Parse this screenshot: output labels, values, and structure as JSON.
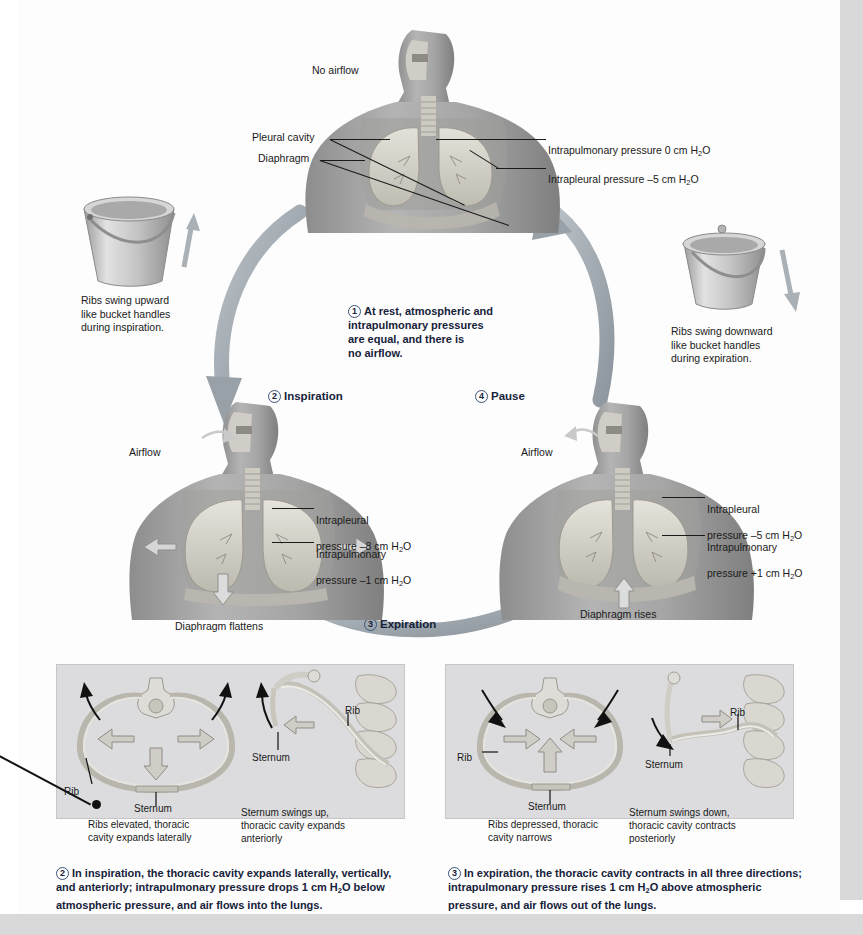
{
  "figure": {
    "background_color": "#fdfdfd",
    "panel_color": "#dcdcde",
    "arrow_color": "#9aa3ab",
    "step_number_color": "#3b5378"
  },
  "top_figure": {
    "airflow_label": "No airflow",
    "left_labels": [
      {
        "text": "Pleural cavity"
      },
      {
        "text": "Diaphragm"
      }
    ],
    "right_labels": [
      {
        "text": "Intrapulmonary pressure 0 cm H",
        "sub": "2",
        "tail": "O"
      },
      {
        "text": "Intrapleural pressure –5 cm H",
        "sub": "2",
        "tail": "O"
      }
    ]
  },
  "center_step": {
    "number": "1",
    "text": "At rest, atmospheric and\nintrapulmonary pressures\nare equal, and there is\nno airflow."
  },
  "buckets": {
    "left": {
      "caption": "Ribs swing upward\nlike bucket handles\nduring inspiration.",
      "arrow_direction": "up"
    },
    "right": {
      "caption": "Ribs swing downward\nlike bucket handles\nduring expiration.",
      "arrow_direction": "down"
    }
  },
  "steps": {
    "inspiration": {
      "number": "2",
      "label": "Inspiration"
    },
    "expiration": {
      "number": "3",
      "label": "Expiration"
    },
    "pause": {
      "number": "4",
      "label": "Pause"
    }
  },
  "left_figure": {
    "airflow_label": "Airflow",
    "labels": [
      {
        "line1": "Intrapleural",
        "line2": "pressure –8 cm H",
        "sub": "2",
        "tail": "O"
      },
      {
        "line1": "Intrapulmonary",
        "line2": "pressure –1 cm H",
        "sub": "2",
        "tail": "O"
      }
    ],
    "diaphragm_label": "Diaphragm flattens"
  },
  "right_figure": {
    "airflow_label": "Airflow",
    "labels": [
      {
        "line1": "Intrapleural",
        "line2": "pressure –5 cm H",
        "sub": "2",
        "tail": "O"
      },
      {
        "line1": "Intrapulmonary",
        "line2": "pressure +1 cm H",
        "sub": "2",
        "tail": "O"
      }
    ],
    "diaphragm_label": "Diaphragm rises"
  },
  "bottom_left_panel": {
    "diagram_a": {
      "labels": [
        "Rib",
        "Sternum"
      ],
      "caption": "Ribs elevated, thoracic\ncavity expands laterally"
    },
    "diagram_b": {
      "labels": [
        "Rib",
        "Sternum"
      ],
      "caption": "Sternum swings up,\nthoracic cavity expands\nanteriorly"
    }
  },
  "bottom_right_panel": {
    "diagram_a": {
      "labels": [
        "Rib",
        "Sternum"
      ],
      "caption": "Ribs depressed, thoracic\ncavity narrows"
    },
    "diagram_b": {
      "labels": [
        "Rib",
        "Sternum"
      ],
      "caption": "Sternum swings down,\nthoracic cavity contracts\nposteriorly"
    }
  },
  "bottom_captions": {
    "left": {
      "number": "2",
      "part1": "In inspiration, the thoracic cavity expands laterally, vertically,\nand anteriorly; intrapulmonary pressure drops 1 cm H",
      "sub": "2",
      "part2": "O below\natmospheric pressure, and air flows into the lungs."
    },
    "right": {
      "number": "3",
      "part1": "In expiration, the thoracic cavity contracts in all three directions;\nintrapulmonary pressure rises 1 cm H",
      "sub": "2",
      "part2": "O above atmospheric\npressure, and air flows out of the lungs."
    }
  }
}
